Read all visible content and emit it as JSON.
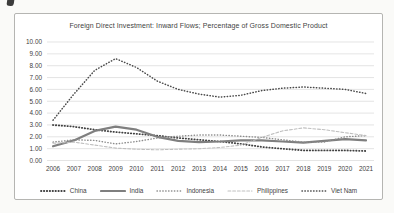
{
  "page": {
    "background": "#fafaf8",
    "frame_fill": "#ffffff",
    "frame_border": "#b5b5b2"
  },
  "chart_data": {
    "type": "line",
    "title": "Foreign Direct Investment: Inward Flows; Percentage of Gross Domestic Product",
    "xlabel": "",
    "ylabel": "",
    "x": [
      2006,
      2007,
      2008,
      2009,
      2010,
      2011,
      2012,
      2013,
      2014,
      2015,
      2016,
      2017,
      2018,
      2019,
      2020,
      2021
    ],
    "series": [
      {
        "name": "China",
        "style": "dotted",
        "color": "#404040",
        "line_width": 1.8,
        "values": [
          3.0,
          2.85,
          2.6,
          2.4,
          2.25,
          2.1,
          1.9,
          1.75,
          1.6,
          1.4,
          1.15,
          1.0,
          0.85,
          0.85,
          0.85,
          0.8
        ]
      },
      {
        "name": "India",
        "style": "solid",
        "color": "#7f7f7f",
        "line_width": 2.2,
        "values": [
          1.2,
          1.7,
          2.5,
          2.85,
          2.6,
          2.0,
          1.65,
          1.55,
          1.6,
          1.7,
          1.7,
          1.6,
          1.5,
          1.65,
          1.8,
          1.7
        ]
      },
      {
        "name": "Indonesia",
        "style": "dotted",
        "color": "#8c8c8c",
        "line_width": 1.4,
        "values": [
          1.55,
          1.75,
          1.7,
          1.4,
          1.6,
          1.9,
          2.05,
          2.15,
          2.15,
          2.05,
          1.95,
          1.75,
          1.55,
          1.55,
          2.0,
          2.1
        ]
      },
      {
        "name": "Philippines",
        "style": "dashed",
        "color": "#bfbfbf",
        "line_width": 1.1,
        "values": [
          1.45,
          1.55,
          1.3,
          1.05,
          0.95,
          0.9,
          0.95,
          1.0,
          1.1,
          1.3,
          1.95,
          2.5,
          2.75,
          2.6,
          2.35,
          2.1
        ]
      },
      {
        "name": "Viet Nam",
        "style": "dotted",
        "color": "#4a4a4a",
        "line_width": 1.5,
        "values": [
          3.4,
          5.6,
          7.6,
          8.6,
          7.85,
          6.7,
          6.0,
          5.6,
          5.35,
          5.5,
          5.9,
          6.1,
          6.2,
          6.1,
          6.0,
          5.65
        ]
      }
    ],
    "ylim": [
      0,
      10
    ],
    "ytick_step": 1,
    "ytick_labels": [
      "0.00",
      "1.00",
      "2.00",
      "3.00",
      "4.00",
      "5.00",
      "6.00",
      "7.00",
      "8.00",
      "9.00",
      "10.00"
    ],
    "grid": true,
    "gridline_color": "#d9d9d9",
    "text_color": "#404040",
    "legend_position": "bottom"
  }
}
